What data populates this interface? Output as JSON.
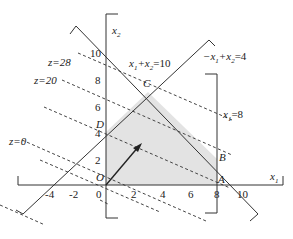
{
  "diagram": {
    "axes": {
      "x_label": "x",
      "x_sub": "1",
      "y_label": "x",
      "y_sub": "2",
      "x_ticks": [
        "-4",
        "-2",
        "0",
        "2",
        "4",
        "6",
        "8",
        "10"
      ],
      "y_ticks": [
        "2",
        "4",
        "6",
        "8",
        "10"
      ]
    },
    "constraints": {
      "c1_a": "x",
      "c1_a_sub": "1",
      "c1_b": "+x",
      "c1_b_sub": "2",
      "c1_c": "=10",
      "c2_a": "−x",
      "c2_a_sub": "1",
      "c2_b": "+x",
      "c2_b_sub": "2",
      "c2_c": "=4",
      "c3_a": "x",
      "c3_a_sub": "1",
      "c3_c": "=8"
    },
    "objective_lines": {
      "z28": "z=28",
      "z20": "z=20",
      "z0": "z=0"
    },
    "points": {
      "O": "O",
      "A": "A",
      "B": "B",
      "C": "C",
      "D": "D"
    },
    "colors": {
      "region_fill": "#e3e3e3",
      "line": "#333333"
    }
  }
}
